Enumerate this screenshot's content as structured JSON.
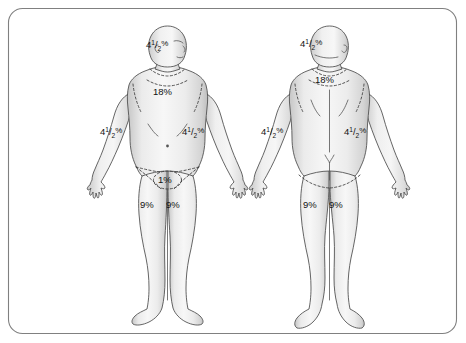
{
  "figure": {
    "background_color": "#ffffff",
    "border_color": "#808080",
    "skin_fill_light": "#f4f4f4",
    "skin_fill_mid": "#e3e3e3",
    "skin_fill_shadow": "#c9c9c9",
    "outline_color": "#4a4a4a",
    "label_color": "#111111"
  },
  "views": {
    "anterior": {
      "name": "anterior-view",
      "labels": {
        "head": {
          "whole": "4",
          "numerator": "1",
          "denominator": "2",
          "percent": "%"
        },
        "trunk": "18%",
        "arm_right": {
          "whole": "4",
          "numerator": "1",
          "denominator": "2",
          "percent": "%"
        },
        "arm_left": {
          "whole": "4",
          "numerator": "1",
          "denominator": "2",
          "percent": "%"
        },
        "genitalia": "1%",
        "leg_right": "9%",
        "leg_left": "9%"
      }
    },
    "posterior": {
      "name": "posterior-view",
      "labels": {
        "head": {
          "whole": "4",
          "numerator": "1",
          "denominator": "2",
          "percent": "%"
        },
        "trunk": "18%",
        "arm_right": {
          "whole": "4",
          "numerator": "1",
          "denominator": "2",
          "percent": "%"
        },
        "arm_left": {
          "whole": "4",
          "numerator": "1",
          "denominator": "2",
          "percent": "%"
        },
        "leg_right": "9%",
        "leg_left": "9%"
      }
    }
  }
}
